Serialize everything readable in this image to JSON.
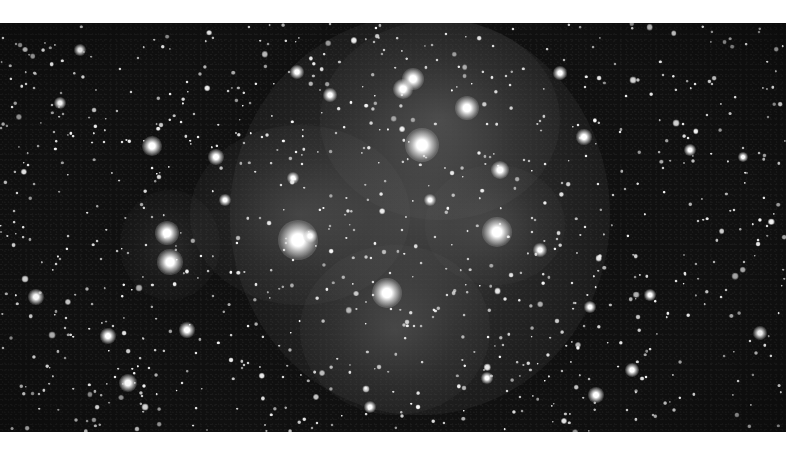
{
  "image": {
    "subject": "Pleiades star cluster with reflection nebulosity",
    "colors": {
      "background_border": "#ffffff",
      "sky": "#101010",
      "nebula": "#8a8a8a",
      "star": "#ffffff"
    },
    "photo_bounds": {
      "x": 0,
      "y": 23,
      "width": 786,
      "height": 409
    }
  },
  "nebula_glows": [
    {
      "x": 420,
      "y": 215,
      "rx": 190,
      "ry": 200,
      "alpha": 0.38
    },
    {
      "x": 440,
      "y": 120,
      "rx": 120,
      "ry": 100,
      "alpha": 0.3
    },
    {
      "x": 300,
      "y": 215,
      "rx": 110,
      "ry": 90,
      "alpha": 0.28
    },
    {
      "x": 395,
      "y": 330,
      "rx": 95,
      "ry": 85,
      "alpha": 0.28
    },
    {
      "x": 495,
      "y": 225,
      "rx": 70,
      "ry": 60,
      "alpha": 0.22
    },
    {
      "x": 170,
      "y": 245,
      "rx": 50,
      "ry": 55,
      "alpha": 0.18
    }
  ],
  "bright_stars": [
    {
      "x": 298,
      "y": 240,
      "size": 40
    },
    {
      "x": 422,
      "y": 145,
      "size": 34
    },
    {
      "x": 497,
      "y": 232,
      "size": 30
    },
    {
      "x": 387,
      "y": 293,
      "size": 30
    },
    {
      "x": 467,
      "y": 108,
      "size": 24
    },
    {
      "x": 413,
      "y": 79,
      "size": 22
    },
    {
      "x": 403,
      "y": 89,
      "size": 20
    },
    {
      "x": 167,
      "y": 233,
      "size": 24
    },
    {
      "x": 170,
      "y": 262,
      "size": 26
    },
    {
      "x": 152,
      "y": 146,
      "size": 20
    },
    {
      "x": 500,
      "y": 170,
      "size": 18
    },
    {
      "x": 128,
      "y": 383,
      "size": 18
    },
    {
      "x": 36,
      "y": 297,
      "size": 16
    },
    {
      "x": 108,
      "y": 336,
      "size": 16
    },
    {
      "x": 187,
      "y": 330,
      "size": 16
    },
    {
      "x": 216,
      "y": 157,
      "size": 16
    },
    {
      "x": 297,
      "y": 72,
      "size": 14
    },
    {
      "x": 330,
      "y": 95,
      "size": 14
    },
    {
      "x": 310,
      "y": 236,
      "size": 14
    },
    {
      "x": 584,
      "y": 137,
      "size": 16
    },
    {
      "x": 596,
      "y": 395,
      "size": 16
    },
    {
      "x": 632,
      "y": 370,
      "size": 14
    },
    {
      "x": 760,
      "y": 333,
      "size": 14
    },
    {
      "x": 560,
      "y": 73,
      "size": 14
    },
    {
      "x": 430,
      "y": 200,
      "size": 12
    },
    {
      "x": 540,
      "y": 250,
      "size": 14
    },
    {
      "x": 590,
      "y": 307,
      "size": 12
    },
    {
      "x": 650,
      "y": 295,
      "size": 12
    },
    {
      "x": 293,
      "y": 178,
      "size": 12
    },
    {
      "x": 370,
      "y": 407,
      "size": 12
    },
    {
      "x": 487,
      "y": 378,
      "size": 12
    },
    {
      "x": 60,
      "y": 103,
      "size": 12
    },
    {
      "x": 80,
      "y": 50,
      "size": 12
    },
    {
      "x": 225,
      "y": 200,
      "size": 12
    },
    {
      "x": 690,
      "y": 150,
      "size": 12
    },
    {
      "x": 743,
      "y": 157,
      "size": 10
    }
  ],
  "faint_star_seed": 45,
  "faint_star_count": 900
}
